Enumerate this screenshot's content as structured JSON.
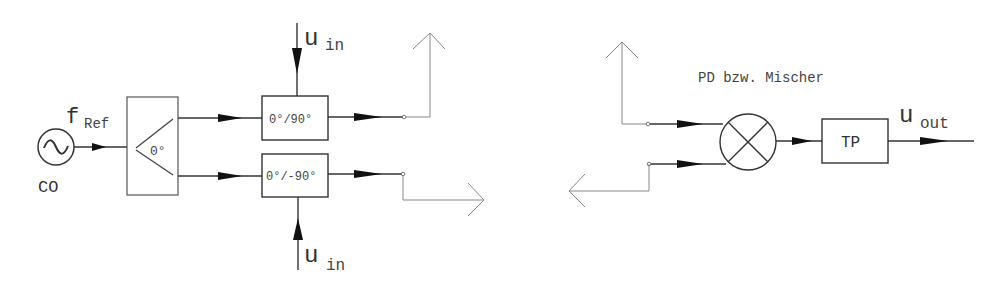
{
  "diagram": {
    "type": "block-diagram",
    "left": {
      "oscillator": {
        "label": "CO",
        "signal_label": "f",
        "signal_sub": "Ref"
      },
      "splitter": {
        "label": "0°"
      },
      "phase_shifter_top": {
        "label": "0°/90°",
        "input_label": "u",
        "input_sub": "in"
      },
      "phase_shifter_bottom": {
        "label": "0°/-90°",
        "input_label": "u",
        "input_sub": "in"
      }
    },
    "right": {
      "mixer_title": "PD bzw. Mischer",
      "lowpass": {
        "label": "TP"
      },
      "output_label": "u",
      "output_sub": "out"
    },
    "colors": {
      "line": "#222222",
      "connector": "#888888"
    }
  }
}
